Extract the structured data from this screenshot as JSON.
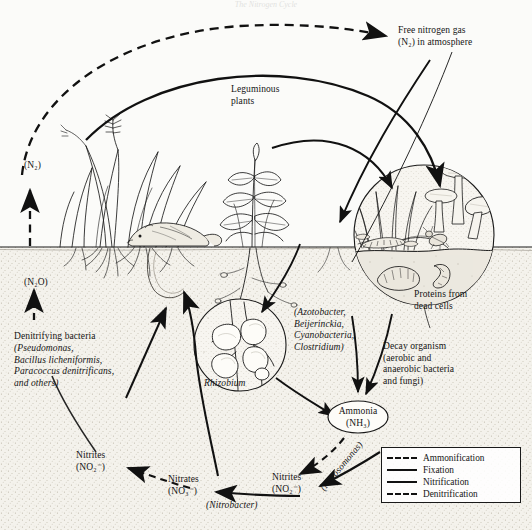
{
  "figure": {
    "title": "The Nitrogen Cycle",
    "domain": "biology-diagram",
    "ink_color": "#1a1a1a",
    "paper_color": "#fbfbf9"
  },
  "labels": {
    "free_nitrogen": "Free nitrogen gas\n(N₂) in atmosphere",
    "leguminous_plants": "Leguminous\nplants",
    "n2_left": "(N₂)",
    "n2o_left": "(N₂O)",
    "denitrifying_head": "Denitrifying bacteria",
    "denitrifying_species": "(Pseudomonas,\nBacillus licheniformis,\nParacoccus denitrificans,\nand others)",
    "rhizobium": "Rhizobium",
    "free_living_fixers": "(Azotobacter,\nBeijerinckia,\nCyanobacteria,\nClostridium)",
    "ammonia": "Ammonia\n(NH₃)",
    "proteins_dead_cells": "Proteins from\ndead cells",
    "decay_organism": "Decay organism\n(aerobic and\nanaerobic bacteria\nand fungi)",
    "nitrites_left": "Nitrites\n(NO₂⁻)",
    "nitrates_center": "Nitrates\n(NO₃⁻)",
    "nitrites_right": "Nitrites\n(NO₂⁻)",
    "nitrosomonas": "(Nitrosomonas)",
    "nitrobacter": "(Nitrobacter)"
  },
  "legend": {
    "items": [
      {
        "label": "Ammonification",
        "style": "dashed"
      },
      {
        "label": "Fixation",
        "style": "solid"
      },
      {
        "label": "Nitrification",
        "style": "solid"
      },
      {
        "label": "Denitrification",
        "style": "dashed"
      }
    ]
  },
  "scene": {
    "soil_line_y": 246,
    "elements": [
      "grass-clump-left",
      "leguminous-plant-center",
      "mole-rodent",
      "root-system",
      "root-nodule-magnifier",
      "decomposer-magnifier",
      "mushrooms",
      "centipede",
      "beetle",
      "earthworms"
    ]
  }
}
